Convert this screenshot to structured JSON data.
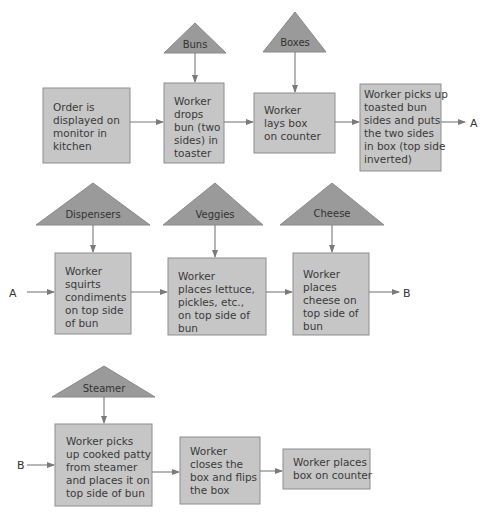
{
  "diagram": {
    "title": "",
    "steps": [
      {
        "id": "s1",
        "lines": [
          "Order is",
          "displayed on",
          "monitor in",
          "kitchen"
        ]
      },
      {
        "id": "s2",
        "lines": [
          "Worker",
          "drops",
          "bun (two",
          "sides) in",
          "toaster"
        ]
      },
      {
        "id": "s3",
        "lines": [
          "Worker",
          "lays box",
          "on counter"
        ]
      },
      {
        "id": "s4",
        "lines": [
          "Worker picks up",
          "toasted bun",
          "sides and puts",
          "the two sides",
          "in box (top side",
          "inverted)"
        ]
      },
      {
        "id": "s5",
        "lines": [
          "Worker",
          "squirts",
          "condiments",
          "on top side",
          "of bun"
        ]
      },
      {
        "id": "s6",
        "lines": [
          "Worker",
          "places lettuce,",
          "pickles, etc.,",
          "on top side of",
          "bun"
        ]
      },
      {
        "id": "s7",
        "lines": [
          "Worker",
          "places",
          "cheese on",
          "top side of",
          "bun"
        ]
      },
      {
        "id": "s8",
        "lines": [
          "Worker picks",
          "up cooked patty",
          "from steamer",
          "and places it on",
          "top side of bun"
        ]
      },
      {
        "id": "s9",
        "lines": [
          "Worker",
          "closes the",
          "box and flips",
          "the box"
        ]
      },
      {
        "id": "s10",
        "lines": [
          "Worker places",
          "box on counter"
        ]
      }
    ],
    "inputs": [
      {
        "id": "i1",
        "label": "Buns",
        "feeds": "s2"
      },
      {
        "id": "i2",
        "label": "Boxes",
        "feeds": "s3"
      },
      {
        "id": "i3",
        "label": "Dispensers",
        "feeds": "s5"
      },
      {
        "id": "i4",
        "label": "Veggies",
        "feeds": "s6"
      },
      {
        "id": "i5",
        "label": "Cheese",
        "feeds": "s7"
      },
      {
        "id": "i6",
        "label": "Steamer",
        "feeds": "s8"
      }
    ],
    "connectors": {
      "a_out": "A",
      "a_in": "A",
      "b_out": "B",
      "b_in": "B"
    },
    "flow": [
      [
        "s1",
        "s2"
      ],
      [
        "s2",
        "s3"
      ],
      [
        "s3",
        "s4"
      ],
      [
        "s4",
        "A"
      ],
      [
        "A",
        "s5"
      ],
      [
        "s5",
        "s6"
      ],
      [
        "s6",
        "s7"
      ],
      [
        "s7",
        "B"
      ],
      [
        "B",
        "s8"
      ],
      [
        "s8",
        "s9"
      ],
      [
        "s9",
        "s10"
      ]
    ]
  }
}
